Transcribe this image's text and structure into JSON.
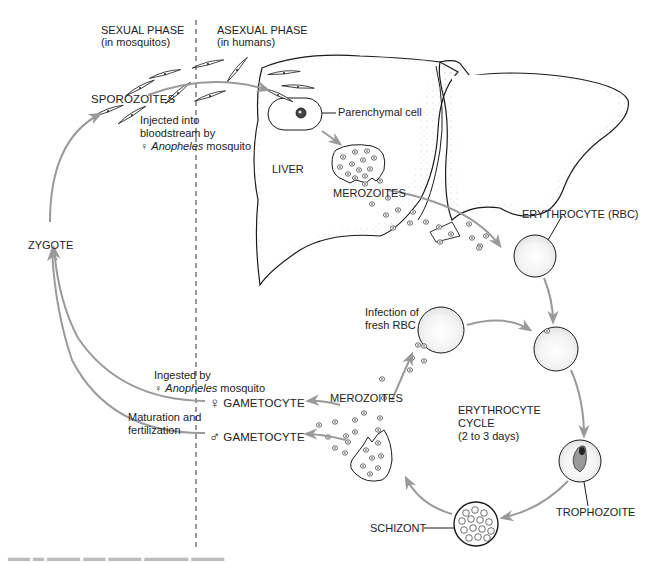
{
  "diagram": {
    "colors": {
      "arrow": "#9a9a9a",
      "outline": "#1a1a1a",
      "stipple": "#c8c8c8",
      "text": "#222222",
      "background": "#ffffff"
    },
    "phases": {
      "sexual": {
        "title": "SEXUAL PHASE",
        "subtitle": "(in mosquitos)"
      },
      "asexual": {
        "title": "ASEXUAL PHASE",
        "subtitle": "(in humans)"
      }
    },
    "labels": {
      "sporozoites": "SPOROZOITES",
      "injected_line1": "Injected into",
      "injected_line2": "bloodstream by",
      "injected_symbol": "♀",
      "injected_species": "Anopheles",
      "injected_suffix": " mosquito",
      "parenchymal_cell": "Parenchymal cell",
      "liver": "LIVER",
      "merozoites_liver": "MEROZOITES",
      "erythrocyte": "ERYTHROCYTE (RBC)",
      "zygote": "ZYGOTE",
      "infection_line1": "Infection of",
      "infection_line2": "fresh RBC",
      "ingested_line1": "Ingested by",
      "ingested_symbol": "♀",
      "ingested_species": "Anopheles",
      "ingested_suffix": " mosquito",
      "female_symbol": "♀",
      "female_gametocyte": "GAMETOCYTE",
      "male_symbol": "♂",
      "male_gametocyte": "GAMETOCYTE",
      "maturation_line1": "Maturation and",
      "maturation_line2": "fertilization",
      "merozoites_blood": "MEROZOITES",
      "cycle_line1": "ERYTHROCYTE",
      "cycle_line2": "CYCLE",
      "cycle_line3": "(2 to 3 days)",
      "trophozoite": "TROPHOZOITE",
      "schizont": "SCHIZONT"
    },
    "caption": "Figure (clipped caption text at bottom edge, not legible)"
  }
}
